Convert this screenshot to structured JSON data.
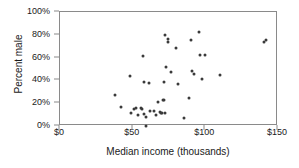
{
  "chart_data": {
    "type": "scatter",
    "title": "",
    "xlabel": "Median income (thousands)",
    "ylabel": "Percent male",
    "xlim": [
      0,
      150
    ],
    "ylim": [
      0,
      100
    ],
    "grid": false,
    "legend": null,
    "xticks": [
      0,
      50,
      100,
      150
    ],
    "xticklabels": [
      "$0",
      "$50",
      "$100",
      "$150"
    ],
    "yticks": [
      0,
      20,
      40,
      60,
      80,
      100
    ],
    "yticklabels": [
      "0%",
      "20%",
      "40%",
      "60%",
      "80%",
      "100%"
    ],
    "marker_color": "#3a3a3a",
    "axis_color": "#8a8a8a",
    "points": [
      {
        "x": 37.5,
        "y": 27.5
      },
      {
        "x": 42.0,
        "y": 16.5
      },
      {
        "x": 48.0,
        "y": 44.0
      },
      {
        "x": 49.0,
        "y": 11.0
      },
      {
        "x": 51.0,
        "y": 14.5
      },
      {
        "x": 52.0,
        "y": 15.5
      },
      {
        "x": 53.5,
        "y": 9.5
      },
      {
        "x": 55.5,
        "y": 16.0
      },
      {
        "x": 56.5,
        "y": 15.0
      },
      {
        "x": 57.0,
        "y": 61.0
      },
      {
        "x": 57.5,
        "y": 10.5
      },
      {
        "x": 58.0,
        "y": 39.0
      },
      {
        "x": 59.0,
        "y": 0.0
      },
      {
        "x": 59.5,
        "y": 8.0
      },
      {
        "x": 61.0,
        "y": 38.0
      },
      {
        "x": 62.0,
        "y": 13.0
      },
      {
        "x": 64.5,
        "y": 13.5
      },
      {
        "x": 66.0,
        "y": 9.5
      },
      {
        "x": 67.5,
        "y": 21.0
      },
      {
        "x": 68.5,
        "y": 12.0
      },
      {
        "x": 69.5,
        "y": 11.5
      },
      {
        "x": 70.5,
        "y": 11.5
      },
      {
        "x": 71.0,
        "y": 23.0
      },
      {
        "x": 71.5,
        "y": 22.5
      },
      {
        "x": 71.5,
        "y": 38.5
      },
      {
        "x": 72.0,
        "y": 11.5
      },
      {
        "x": 72.5,
        "y": 79.5
      },
      {
        "x": 73.0,
        "y": 51.5
      },
      {
        "x": 74.0,
        "y": 76.0
      },
      {
        "x": 74.5,
        "y": 74.0
      },
      {
        "x": 76.5,
        "y": 47.0
      },
      {
        "x": 80.0,
        "y": 68.5
      },
      {
        "x": 81.5,
        "y": 36.5
      },
      {
        "x": 85.0,
        "y": 7.0
      },
      {
        "x": 88.5,
        "y": 25.0
      },
      {
        "x": 90.0,
        "y": 75.5
      },
      {
        "x": 90.5,
        "y": 48.0
      },
      {
        "x": 92.0,
        "y": 45.5
      },
      {
        "x": 95.5,
        "y": 82.5
      },
      {
        "x": 96.5,
        "y": 62.0
      },
      {
        "x": 98.0,
        "y": 41.5
      },
      {
        "x": 99.5,
        "y": 62.0
      },
      {
        "x": 110.0,
        "y": 45.0
      },
      {
        "x": 140.5,
        "y": 74.0
      },
      {
        "x": 141.5,
        "y": 75.5
      }
    ]
  }
}
